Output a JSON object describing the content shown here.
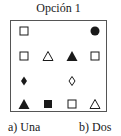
{
  "title": "Opción 1",
  "grid": {
    "rows": 4,
    "cols": 4,
    "cells": [
      {
        "row": 0,
        "col": 0,
        "shape": "square",
        "fill": "hollow"
      },
      {
        "row": 0,
        "col": 3,
        "shape": "circle",
        "fill": "filled"
      },
      {
        "row": 1,
        "col": 0,
        "shape": "square",
        "fill": "hollow"
      },
      {
        "row": 1,
        "col": 1,
        "shape": "triangle",
        "fill": "hollow"
      },
      {
        "row": 1,
        "col": 2,
        "shape": "triangle",
        "fill": "filled"
      },
      {
        "row": 1,
        "col": 3,
        "shape": "square",
        "fill": "hollow"
      },
      {
        "row": 2,
        "col": 0,
        "shape": "diamond",
        "fill": "filled"
      },
      {
        "row": 2,
        "col": 2,
        "shape": "diamond",
        "fill": "hollow"
      },
      {
        "row": 3,
        "col": 0,
        "shape": "triangle",
        "fill": "filled"
      },
      {
        "row": 3,
        "col": 1,
        "shape": "square",
        "fill": "filled"
      },
      {
        "row": 3,
        "col": 2,
        "shape": "square",
        "fill": "hollow"
      },
      {
        "row": 3,
        "col": 3,
        "shape": "triangle",
        "fill": "hollow"
      }
    ]
  },
  "options": [
    {
      "label": "a) Una"
    },
    {
      "label": "b) Dos"
    }
  ],
  "colors": {
    "ink": "#1a1a1a",
    "frame": "#555555"
  }
}
